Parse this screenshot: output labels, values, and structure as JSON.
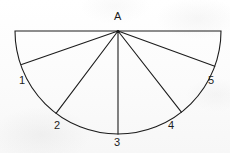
{
  "figure": {
    "name": "semicircle-fan-diagram",
    "background_color": "#fdfdfd",
    "stroke_color": "#1c1c1c",
    "label_color": "#1c1c1c",
    "stroke_width": 1.1,
    "geometry": {
      "center": {
        "x": 118,
        "y": 31
      },
      "radius": 103,
      "diameter_left": {
        "x": 15,
        "y": 31
      },
      "diameter_right": {
        "x": 221,
        "y": 31
      },
      "arc_bottom": {
        "x": 118,
        "y": 134
      }
    },
    "apex": {
      "point_id": "A",
      "label": "A",
      "x": 118,
      "y": 31,
      "label_x": 114,
      "label_y": 11
    },
    "radii": [
      {
        "point_id": "1",
        "label": "1",
        "angle_deg": 161,
        "x": 21,
        "y": 64,
        "label_x": 19,
        "label_y": 75
      },
      {
        "point_id": "2",
        "label": "2",
        "angle_deg": 127,
        "x": 56,
        "y": 113,
        "label_x": 54,
        "label_y": 120
      },
      {
        "point_id": "3",
        "label": "3",
        "angle_deg": 90,
        "x": 118,
        "y": 134,
        "label_x": 114,
        "label_y": 137
      },
      {
        "point_id": "4",
        "label": "4",
        "angle_deg": 52,
        "x": 181,
        "y": 112,
        "label_x": 168,
        "label_y": 120
      },
      {
        "point_id": "5",
        "label": "5",
        "angle_deg": 20,
        "x": 215,
        "y": 66,
        "label_x": 208,
        "label_y": 75
      }
    ]
  }
}
